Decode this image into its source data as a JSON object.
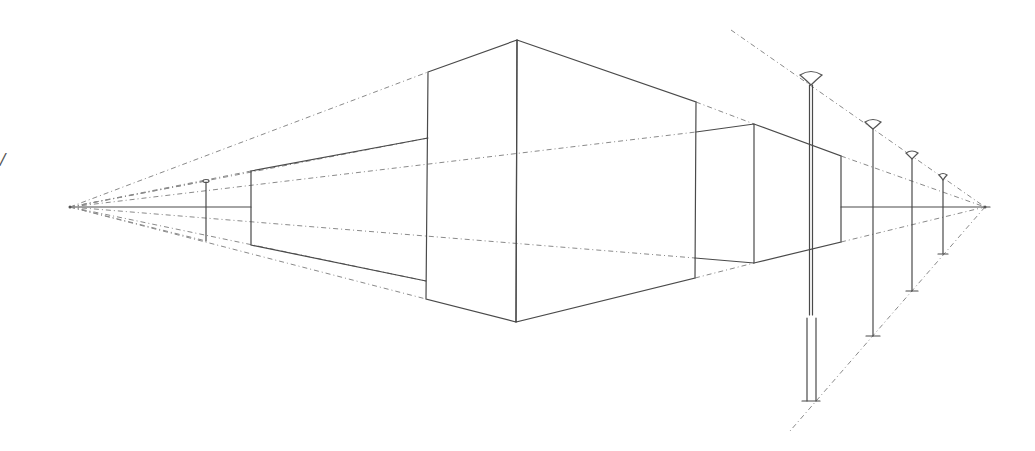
{
  "drawing": {
    "title": "Two-point perspective sketch: buildings and street lamps",
    "stray_mark": "/",
    "horizon_y": 207,
    "vanishing_points": {
      "left": [
        70,
        207
      ],
      "right": [
        985,
        207
      ]
    },
    "colors": {
      "line": "#4a4a4a",
      "construction": "#8a8a8a",
      "background": "#ffffff"
    },
    "buildings": [
      {
        "name": "left-low-building",
        "outline": [
          [
            251,
            171
          ],
          [
            428,
            138
          ],
          [
            426,
            281
          ],
          [
            251,
            245
          ]
        ]
      },
      {
        "name": "main-tall-building",
        "left_face": [
          [
            428,
            72
          ],
          [
            517,
            40
          ],
          [
            516,
            322
          ],
          [
            426,
            299
          ]
        ],
        "right_face": [
          [
            517,
            40
          ],
          [
            696,
            102
          ],
          [
            695,
            278
          ],
          [
            516,
            322
          ]
        ]
      },
      {
        "name": "right-mid-building",
        "left_face": [
          [
            696,
            132
          ],
          [
            754,
            124
          ],
          [
            754,
            263
          ],
          [
            695,
            258
          ]
        ],
        "right_face": [
          [
            754,
            124
          ],
          [
            841,
            156
          ],
          [
            841,
            242
          ],
          [
            754,
            263
          ]
        ]
      }
    ],
    "lamps": [
      {
        "name": "lamp-far-left",
        "x": 206,
        "top": 181,
        "bottom": 241,
        "head_w": 6
      },
      {
        "name": "lamp-1",
        "x": 811,
        "top": 75,
        "bottom": 401,
        "head_w": 20
      },
      {
        "name": "lamp-2",
        "x": 873,
        "top": 122,
        "bottom": 336,
        "head_w": 14
      },
      {
        "name": "lamp-3",
        "x": 912,
        "top": 153,
        "bottom": 291,
        "head_w": 11
      },
      {
        "name": "lamp-4",
        "x": 943,
        "top": 175,
        "bottom": 254,
        "head_w": 8
      }
    ]
  }
}
